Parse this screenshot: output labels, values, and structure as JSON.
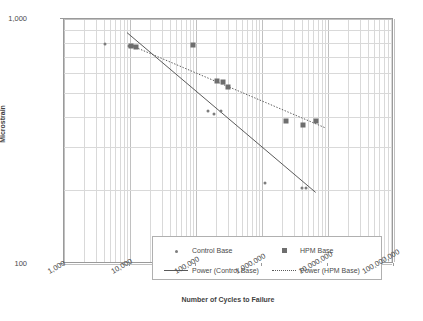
{
  "chart_data": {
    "type": "scatter",
    "title": "",
    "xlabel": "Number of Cycles to Failure",
    "ylabel": "Microstrain",
    "xscale": "log",
    "yscale": "log",
    "xlim": [
      1000,
      100000000
    ],
    "ylim": [
      100,
      1000
    ],
    "xticks": [
      "1,000",
      "10,000",
      "100,000",
      "1,000,000",
      "10,000,000",
      "100,000,000"
    ],
    "yticks": [
      "100",
      "1,000"
    ],
    "grid": true,
    "legend_position": "inside-bottom-left",
    "series": [
      {
        "name": "Control Base",
        "marker": "circle",
        "color": "#7d7d7d",
        "points": [
          {
            "x": 4200,
            "y": 790
          },
          {
            "x": 9500,
            "y": 775
          },
          {
            "x": 11000,
            "y": 775
          },
          {
            "x": 12000,
            "y": 770
          },
          {
            "x": 150000,
            "y": 420
          },
          {
            "x": 190000,
            "y": 410
          },
          {
            "x": 240000,
            "y": 420
          },
          {
            "x": 1100000,
            "y": 215
          },
          {
            "x": 4000000,
            "y": 205
          },
          {
            "x": 4600000,
            "y": 205
          }
        ]
      },
      {
        "name": "HPM Base",
        "marker": "square",
        "color": "#6e6e6e",
        "points": [
          {
            "x": 10500,
            "y": 775
          },
          {
            "x": 12500,
            "y": 770
          },
          {
            "x": 90000,
            "y": 780
          },
          {
            "x": 210000,
            "y": 560
          },
          {
            "x": 260000,
            "y": 555
          },
          {
            "x": 300000,
            "y": 530
          },
          {
            "x": 2300000,
            "y": 385
          },
          {
            "x": 4200000,
            "y": 370
          },
          {
            "x": 6500000,
            "y": 385
          }
        ]
      }
    ],
    "trendlines": [
      {
        "name": "Power (Control Base)",
        "style": "solid",
        "color": "#5a5a5a",
        "from": {
          "x": 9000,
          "y": 880
        },
        "to": {
          "x": 6500000,
          "y": 196
        }
      },
      {
        "name": "Power (HPM Base)",
        "style": "dotted",
        "color": "#5a5a5a",
        "from": {
          "x": 11000,
          "y": 775
        },
        "to": {
          "x": 9000000,
          "y": 360
        }
      }
    ],
    "legend_entries": [
      {
        "label": "Control Base",
        "symbol": "dot"
      },
      {
        "label": "HPM Base",
        "symbol": "square"
      },
      {
        "label": "Power (Control Base)",
        "symbol": "solid-line"
      },
      {
        "label": "Power (HPM Base)",
        "symbol": "dotted-line"
      }
    ]
  }
}
